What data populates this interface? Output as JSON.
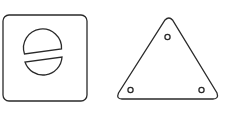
{
  "figure": {
    "stroke_color": "#2a2a2a",
    "background": "#ffffff",
    "items": [
      {
        "name": "square-plate",
        "shape": "rounded-square",
        "feature": "slotted-screw-head"
      },
      {
        "name": "triangle-plate",
        "shape": "rounded-triangle",
        "feature": "three-mounting-holes"
      }
    ]
  }
}
